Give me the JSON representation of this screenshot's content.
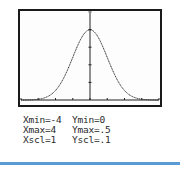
{
  "chart_data": {
    "type": "line",
    "title": "",
    "function": "standard normal density",
    "series": [
      {
        "name": "normal curve",
        "x": [
          -4,
          -3.5,
          -3,
          -2.5,
          -2,
          -1.5,
          -1,
          -0.5,
          0,
          0.5,
          1,
          1.5,
          2,
          2.5,
          3,
          3.5,
          4
        ],
        "values": [
          0.0001,
          0.0009,
          0.0044,
          0.0175,
          0.054,
          0.1295,
          0.242,
          0.3521,
          0.3989,
          0.3521,
          0.242,
          0.1295,
          0.054,
          0.0175,
          0.0044,
          0.0009,
          0.0001
        ]
      }
    ],
    "xlim": [
      -4,
      4
    ],
    "ylim": [
      0,
      0.5
    ],
    "xscl": 1,
    "yscl": 0.1,
    "grid": false,
    "xlabel": "",
    "ylabel": ""
  },
  "window": {
    "xmin": "Xmin=-4",
    "xmax": "Xmax=4",
    "xscl": "Xscl=1",
    "ymin": "Ymin=0",
    "ymax": "Ymax=.5",
    "yscl": "Yscl=.1"
  },
  "colors": {
    "frame": "#1a1a1a",
    "curve": "#222222",
    "rule": "#5b9bd5"
  }
}
